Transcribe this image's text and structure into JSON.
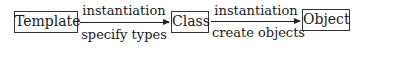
{
  "diagram": {
    "nodes": [
      {
        "id": "template",
        "label": "Template"
      },
      {
        "id": "class",
        "label": "Class"
      },
      {
        "id": "object",
        "label": "Object"
      }
    ],
    "edges": [
      {
        "from": "template",
        "to": "class",
        "top_label": "instantiation",
        "bottom_label": "specify types"
      },
      {
        "from": "class",
        "to": "object",
        "top_label": "instantiation",
        "bottom_label": "create objects"
      }
    ]
  }
}
